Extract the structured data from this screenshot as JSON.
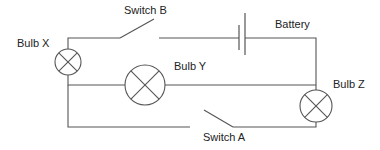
{
  "diagram": {
    "type": "circuit",
    "colors": {
      "line": "#555555",
      "text": "#222222",
      "background": "#ffffff"
    },
    "labels": {
      "bulb_x": "Bulb X",
      "bulb_y": "Bulb Y",
      "bulb_z": "Bulb Z",
      "switch_a": "Switch A",
      "switch_b": "Switch B",
      "battery": "Battery"
    },
    "components": [
      {
        "id": "bulb_x",
        "kind": "bulb",
        "label": "Bulb X"
      },
      {
        "id": "bulb_y",
        "kind": "bulb",
        "label": "Bulb Y"
      },
      {
        "id": "bulb_z",
        "kind": "bulb",
        "label": "Bulb Z"
      },
      {
        "id": "switch_a",
        "kind": "switch",
        "state": "open",
        "label": "Switch A"
      },
      {
        "id": "switch_b",
        "kind": "switch",
        "state": "open",
        "label": "Switch B"
      },
      {
        "id": "battery",
        "kind": "cell",
        "label": "Battery"
      }
    ]
  }
}
